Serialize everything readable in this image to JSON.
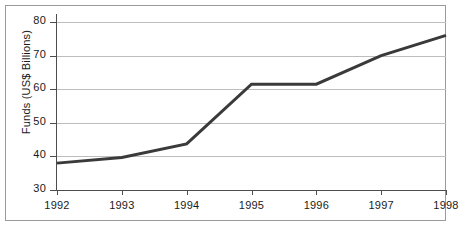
{
  "chart_data": {
    "type": "line",
    "title": "",
    "subtitle": "",
    "xlabel": "",
    "ylabel": "Funds (US$ Billions)",
    "categories": [
      "1992",
      "1993",
      "1994",
      "1995",
      "1996",
      "1997",
      "1998"
    ],
    "x": [
      1992,
      1993,
      1994,
      1995,
      1996,
      1997,
      1998
    ],
    "values": [
      38,
      39.7,
      43.7,
      61.5,
      61.5,
      70,
      76
    ],
    "series": [
      {
        "name": "Funds",
        "values": [
          38,
          39.7,
          43.7,
          61.5,
          61.5,
          70,
          76
        ],
        "color": "#3a3a3a",
        "line_width": 3
      }
    ],
    "xlim": [
      1992,
      1998
    ],
    "ylim": [
      30,
      80
    ],
    "yticks": [
      30,
      40,
      50,
      60,
      70,
      80
    ],
    "ytick_labels": [
      "30",
      "40",
      "50",
      "60",
      "70",
      "80"
    ],
    "xticks": [
      1992,
      1993,
      1994,
      1995,
      1996,
      1997,
      1998
    ],
    "xtick_labels": [
      "1992",
      "1993",
      "1994",
      "1995",
      "1996",
      "1997",
      "1998"
    ],
    "grid": true,
    "grid_axis": "y",
    "grid_color": "#bdbdbd",
    "legend": false,
    "legend_position": "none",
    "annotations": [],
    "axis_color": "#4d4d4d",
    "background": "#ffffff",
    "border_color": "#9a9a9a"
  }
}
